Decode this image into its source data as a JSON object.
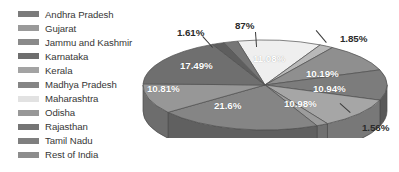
{
  "chart_data": {
    "type": "pie",
    "title": "",
    "subtitle": "",
    "xlabel": "",
    "ylabel": "",
    "legend_position": "left",
    "three_d": true,
    "grid": false,
    "unit": "%",
    "categories": [
      "Andhra Pradesh",
      "Gujarat",
      "Jammu and Kashmir",
      "Karnataka",
      "Kerala",
      "Madhya Pradesh",
      "Maharashtra",
      "Odisha",
      "Rajasthan",
      "Tamil Nadu",
      "Rest of India"
    ],
    "values": [
      11.08,
      1.85,
      10.19,
      10.94,
      10.98,
      1.56,
      21.6,
      10.81,
      17.49,
      1.61,
      87
    ],
    "labels": [
      "11.08%",
      "1.85%",
      "10.19%",
      "10.94%",
      "10.98%",
      "1.56%",
      "21.6%",
      "10.81%",
      "17.49%",
      "1.61%",
      "87%"
    ],
    "colors": [
      "#efefef",
      "#b9b9b9",
      "#8f8f8f",
      "#7c7c7c",
      "#a6a6a6",
      "#9c9c9c",
      "#858585",
      "#979797",
      "#6f6f6f",
      "#5e5e5e",
      "#767676"
    ]
  },
  "legend": {
    "items": [
      {
        "label": "Andhra Pradesh",
        "color": "#7b7b7b"
      },
      {
        "label": "Gujarat",
        "color": "#9a9a9a"
      },
      {
        "label": "Jammu and Kashmir",
        "color": "#8a8a8a"
      },
      {
        "label": "Karnataka",
        "color": "#6e6e6e"
      },
      {
        "label": "Kerala",
        "color": "#a3a3a3"
      },
      {
        "label": "Madhya Pradesh",
        "color": "#858585"
      },
      {
        "label": "Maharashtra",
        "color": "#e2e2e2"
      },
      {
        "label": "Odisha",
        "color": "#989898"
      },
      {
        "label": "Rajasthan",
        "color": "#757575"
      },
      {
        "label": "Tamil Nadu",
        "color": "#7f7f7f"
      },
      {
        "label": "Rest of India",
        "color": "#8d8d8d"
      }
    ]
  },
  "pie_labels": {
    "maharashtra": "11.08%",
    "odisha": "1.85%",
    "rajasthan": "10.19%",
    "tamil_nadu": "10.94%",
    "rest_of_india": "10.98%",
    "small_right": "1.56%",
    "andhra_pradesh": "21.6%",
    "gujarat": "10.81%",
    "jammu_kashmir": "17.49%",
    "karnataka": "1.61%",
    "kerala": "87%"
  }
}
